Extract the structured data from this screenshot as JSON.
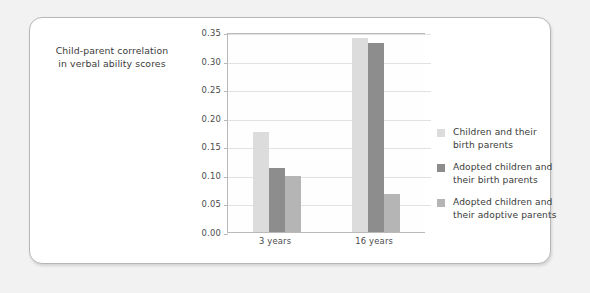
{
  "chart_data": {
    "type": "bar",
    "title": "",
    "subtitle": "",
    "ylabel_line1": "Child-parent correlation",
    "ylabel_line2": "in verbal ability scores",
    "xlabel": "",
    "categories": [
      "3 years",
      "16 years"
    ],
    "series": [
      {
        "name_line1": "Children and their",
        "name_line2": "birth parents",
        "color": "#dcdcdc",
        "values": [
          0.175,
          0.34
        ]
      },
      {
        "name_line1": "Adopted children and",
        "name_line2": "their birth parents",
        "color": "#8d8d8d",
        "values": [
          0.112,
          0.33
        ]
      },
      {
        "name_line1": "Adopted children and",
        "name_line2": "their adoptive parents",
        "color": "#b5b5b5",
        "values": [
          0.098,
          0.066
        ]
      }
    ],
    "ylim": [
      0.0,
      0.35
    ],
    "ytick_values": [
      "0.00",
      "0.05",
      "0.10",
      "0.15",
      "0.20",
      "0.25",
      "0.30",
      "0.35"
    ],
    "grid": true,
    "legend_position": "right"
  }
}
